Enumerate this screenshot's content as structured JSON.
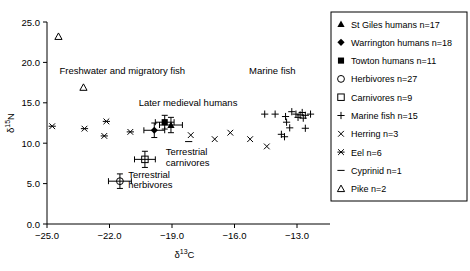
{
  "chart_data": {
    "type": "scatter",
    "title": "",
    "xlabel": "δ¹³C",
    "ylabel": "δ¹⁵N",
    "xlim": [
      -25.0,
      -11.8
    ],
    "ylim": [
      0.0,
      25.0
    ],
    "xticks": [
      "-25.0",
      "-22.0",
      "-19.0",
      "-16.0",
      "-13.0"
    ],
    "xtick_values": [
      -25.0,
      -22.0,
      -19.0,
      -16.0,
      -13.0
    ],
    "yticks": [
      "0.0",
      "5.0",
      "10.0",
      "15.0",
      "20.0",
      "25.0"
    ],
    "ytick_values": [
      0.0,
      5.0,
      10.0,
      15.0,
      20.0,
      25.0
    ],
    "grid": false,
    "legend_position": "right-outside",
    "annotations": [
      {
        "text": "Freshwater and migratory fish",
        "x": -24.4,
        "y": 18.6,
        "anchor": "start"
      },
      {
        "text": "Later medieval humans",
        "x": -20.6,
        "y": 14.6,
        "anchor": "start"
      },
      {
        "text": "Marine fish",
        "x": -15.3,
        "y": 18.6,
        "anchor": "start"
      },
      {
        "text": "Terrestrial",
        "x": -19.3,
        "y": 8.5,
        "anchor": "start"
      },
      {
        "text": "carnivores",
        "x": -19.3,
        "y": 7.2,
        "anchor": "start"
      },
      {
        "text": "Terrestrial",
        "x": -21.1,
        "y": 5.7,
        "anchor": "start"
      },
      {
        "text": "herbivores",
        "x": -21.1,
        "y": 4.4,
        "anchor": "start"
      }
    ],
    "series": [
      {
        "name": "St Giles humans n=17",
        "marker": "filled-triangle",
        "points": [
          {
            "x": -19.05,
            "y": 12.25,
            "xerr": 0.55,
            "yerr": 0.95
          }
        ]
      },
      {
        "name": "Warrington humans n=18",
        "marker": "filled-diamond",
        "points": [
          {
            "x": -19.85,
            "y": 11.6,
            "xerr": 0.5,
            "yerr": 0.9
          }
        ]
      },
      {
        "name": "Towton humans n=11",
        "marker": "filled-square",
        "points": [
          {
            "x": -19.35,
            "y": 12.6,
            "xerr": 0.45,
            "yerr": 0.85
          }
        ]
      },
      {
        "name": "Herbivores n=27",
        "marker": "open-circle",
        "points": [
          {
            "x": -21.5,
            "y": 5.3,
            "xerr": 0.55,
            "yerr": 0.9
          }
        ]
      },
      {
        "name": "Carnivores n=9",
        "marker": "open-square",
        "points": [
          {
            "x": -20.3,
            "y": 8.0,
            "xerr": 0.5,
            "yerr": 1.0
          }
        ]
      },
      {
        "name": "Marine fish n=15",
        "marker": "plus",
        "points": [
          {
            "x": -14.55,
            "y": 13.6
          },
          {
            "x": -14.05,
            "y": 13.6
          },
          {
            "x": -13.55,
            "y": 13.3
          },
          {
            "x": -13.25,
            "y": 13.9
          },
          {
            "x": -13.05,
            "y": 13.6
          },
          {
            "x": -12.95,
            "y": 13.2
          },
          {
            "x": -12.85,
            "y": 13.5
          },
          {
            "x": -12.75,
            "y": 13.8
          },
          {
            "x": -12.7,
            "y": 13.1
          },
          {
            "x": -12.6,
            "y": 13.45
          },
          {
            "x": -12.35,
            "y": 13.6
          },
          {
            "x": -13.5,
            "y": 12.6
          },
          {
            "x": -13.35,
            "y": 11.9
          },
          {
            "x": -12.6,
            "y": 11.85
          },
          {
            "x": -13.75,
            "y": 11.1
          },
          {
            "x": -13.6,
            "y": 10.8
          }
        ]
      },
      {
        "name": "Herring n=3",
        "marker": "cross-x",
        "points": [
          {
            "x": -18.1,
            "y": 11.0
          },
          {
            "x": -16.95,
            "y": 10.5
          },
          {
            "x": -16.2,
            "y": 11.3
          },
          {
            "x": -15.25,
            "y": 10.5
          },
          {
            "x": -14.45,
            "y": 9.6
          }
        ]
      },
      {
        "name": "Eel n=6",
        "marker": "asterisk",
        "points": [
          {
            "x": -24.75,
            "y": 12.1
          },
          {
            "x": -23.2,
            "y": 11.8
          },
          {
            "x": -22.15,
            "y": 12.7
          },
          {
            "x": -22.25,
            "y": 10.9
          },
          {
            "x": -21.0,
            "y": 11.4
          }
        ]
      },
      {
        "name": "Cyprinid n=1",
        "marker": "dash",
        "points": [
          {
            "x": -18.2,
            "y": 10.2
          }
        ]
      },
      {
        "name": "Pike n=2",
        "marker": "open-triangle",
        "points": [
          {
            "x": -24.45,
            "y": 23.2
          },
          {
            "x": -23.25,
            "y": 16.9
          }
        ]
      }
    ]
  },
  "legend": {
    "items": [
      {
        "label": "St Giles humans n=17",
        "marker": "filled-triangle"
      },
      {
        "label": "Warrington humans n=18",
        "marker": "filled-diamond"
      },
      {
        "label": "Towton humans n=11",
        "marker": "filled-square"
      },
      {
        "label": "Herbivores n=27",
        "marker": "open-circle"
      },
      {
        "label": "Carnivores n=9",
        "marker": "open-square"
      },
      {
        "label": "Marine fish n=15",
        "marker": "plus"
      },
      {
        "label": "Herring n=3",
        "marker": "cross-x"
      },
      {
        "label": "Eel n=6",
        "marker": "asterisk"
      },
      {
        "label": "Cyprinid n=1",
        "marker": "dash"
      },
      {
        "label": "Pike n=2",
        "marker": "open-triangle"
      }
    ]
  },
  "colors": {
    "marker": "#000000",
    "axis": "#000000",
    "background": "#ffffff"
  }
}
